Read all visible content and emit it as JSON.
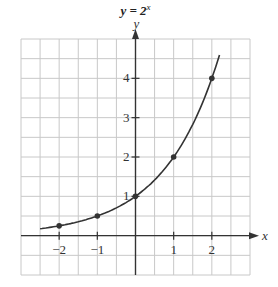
{
  "chart_data": {
    "type": "line",
    "title_base": "y = 2",
    "title_exp": "x",
    "xlabel": "x",
    "ylabel": "y",
    "xlim": [
      -3,
      3
    ],
    "ylim": [
      -1,
      5
    ],
    "grid": true,
    "grid_step": 0.5,
    "x_ticks": [
      -2,
      -1,
      1,
      2
    ],
    "x_tick_labels": [
      "−2",
      "−1",
      "1",
      "2"
    ],
    "y_ticks": [
      1,
      2,
      3,
      4
    ],
    "y_tick_labels": [
      "1",
      "2",
      "3",
      "4"
    ],
    "series": [
      {
        "name": "y = 2^x",
        "function": "2^x",
        "x_range": [
          -2.5,
          2.2
        ],
        "points": [
          {
            "x": -2,
            "y": 0.25
          },
          {
            "x": -1,
            "y": 0.5
          },
          {
            "x": 0,
            "y": 1
          },
          {
            "x": 1,
            "y": 2
          },
          {
            "x": 2,
            "y": 4
          }
        ]
      }
    ],
    "legend": null
  }
}
